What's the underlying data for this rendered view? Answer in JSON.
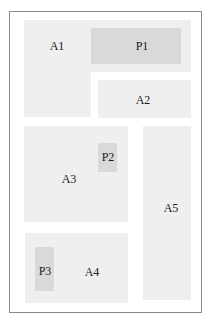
{
  "diagram": {
    "type": "floor-plan-layout",
    "colors": {
      "frame": "#8a8a8a",
      "area": "#efefef",
      "panel": "#d9d9d9",
      "text": "#1a1a1a"
    },
    "areas": [
      {
        "id": "A1",
        "label": "A1"
      },
      {
        "id": "A2",
        "label": "A2"
      },
      {
        "id": "A3",
        "label": "A3"
      },
      {
        "id": "A4",
        "label": "A4"
      },
      {
        "id": "A5",
        "label": "A5"
      }
    ],
    "panels": [
      {
        "id": "P1",
        "label": "P1",
        "inside": "A1"
      },
      {
        "id": "P2",
        "label": "P2",
        "inside": "A3"
      },
      {
        "id": "P3",
        "label": "P3",
        "inside": "A4"
      }
    ]
  }
}
